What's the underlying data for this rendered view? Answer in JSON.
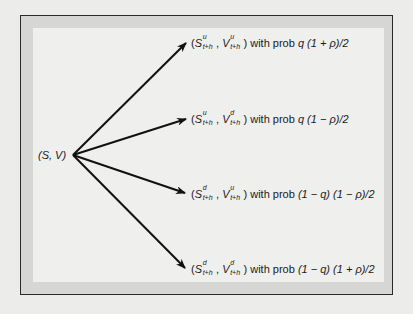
{
  "diagram": {
    "type": "tree",
    "root": {
      "label": "(S, V)"
    },
    "branches": [
      {
        "s_sup": "u",
        "v_sup": "u",
        "sub": "t+h",
        "with_prob_text": "with prob",
        "prob": "q (1 + ρ)/2"
      },
      {
        "s_sup": "u",
        "v_sup": "d",
        "sub": "t+h",
        "with_prob_text": "with prob",
        "prob": "q (1 − ρ)/2"
      },
      {
        "s_sup": "d",
        "v_sup": "u",
        "sub": "t+h",
        "with_prob_text": "with prob",
        "prob": "(1 − q) (1 − ρ)/2"
      },
      {
        "s_sup": "d",
        "v_sup": "d",
        "sub": "t+h",
        "with_prob_text": "with prob",
        "prob": "(1 − q) (1 + ρ)/2"
      }
    ],
    "symbols": {
      "S": "S",
      "V": "V",
      "open": "(",
      "comma": ",",
      "close": ")"
    },
    "colors": {
      "frame_border": "#2a2a2a",
      "frame_band": "#d6d6d4",
      "panel": "#efefed",
      "arrow": "#111111",
      "page": "#ececea"
    }
  }
}
